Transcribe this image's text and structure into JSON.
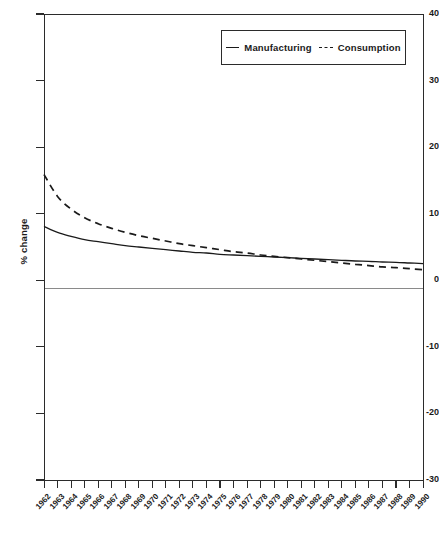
{
  "chart_data": {
    "type": "line",
    "title": "",
    "subtitle": "",
    "xlabel": "",
    "ylabel": "% change",
    "ylim": [
      -30,
      40
    ],
    "ytick_labels": [
      "40",
      "30",
      "20",
      "10",
      "0",
      "-10",
      "-20",
      "-30"
    ],
    "ytick_values": [
      40,
      30,
      20,
      10,
      0,
      -10,
      -20,
      -30
    ],
    "grid": false,
    "zero_line": true,
    "legend_position": "top-center",
    "x": [
      1962,
      1963,
      1964,
      1965,
      1966,
      1967,
      1968,
      1969,
      1970,
      1971,
      1972,
      1973,
      1974,
      1975,
      1976,
      1977,
      1978,
      1979,
      1980,
      1981,
      1982,
      1983,
      1984,
      1985,
      1986,
      1987,
      1988,
      1989,
      1990
    ],
    "categories": [
      "1962",
      "1963",
      "1964",
      "1965",
      "1966",
      "1967",
      "1968",
      "1969",
      "1970",
      "1971",
      "1972",
      "1973",
      "1974",
      "1975",
      "1976",
      "1977",
      "1978",
      "1979",
      "1980",
      "1981",
      "1982",
      "1983",
      "1984",
      "1985",
      "1986",
      "1987",
      "1988",
      "1989",
      "1990"
    ],
    "series": [
      {
        "name": "Manufacturing",
        "style": "solid",
        "color": "#1a1a1a",
        "values": [
          8.1,
          7.2,
          6.6,
          6.1,
          5.8,
          5.5,
          5.2,
          5.0,
          4.8,
          4.6,
          4.4,
          4.2,
          4.1,
          3.9,
          3.8,
          3.7,
          3.6,
          3.5,
          3.4,
          3.3,
          3.2,
          3.1,
          3.0,
          2.9,
          2.85,
          2.75,
          2.7,
          2.6,
          2.5
        ]
      },
      {
        "name": "Consumption",
        "style": "dashed",
        "color": "#1a1a1a",
        "values": [
          15.9,
          12.6,
          10.7,
          9.4,
          8.5,
          7.8,
          7.2,
          6.7,
          6.3,
          5.9,
          5.5,
          5.2,
          4.9,
          4.6,
          4.3,
          4.1,
          3.8,
          3.6,
          3.4,
          3.2,
          3.0,
          2.8,
          2.6,
          2.4,
          2.2,
          2.0,
          1.9,
          1.75,
          1.6
        ]
      }
    ],
    "annotations": []
  },
  "legend": {
    "items": [
      {
        "label": "Manufacturing",
        "dash": "solid"
      },
      {
        "label": "Consumption",
        "dash": "dashed"
      }
    ]
  },
  "axis": {
    "y_title": "% change"
  },
  "colors": {
    "axis": "#2b2b2b",
    "series": "#1a1a1a",
    "zero_line": "#8a8a8a",
    "background": "#ffffff"
  }
}
